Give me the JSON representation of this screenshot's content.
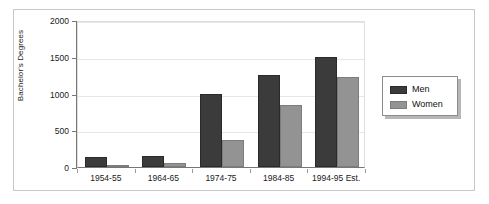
{
  "chart_data": {
    "type": "bar",
    "title": "",
    "xlabel": "",
    "ylabel": "Bachelor's Degrees",
    "ylim": [
      0,
      2000
    ],
    "yticks": [
      0,
      500,
      1000,
      1500,
      2000
    ],
    "ytick_labels": [
      "0",
      "500",
      "1000",
      "1500",
      "2000"
    ],
    "grid": true,
    "legend_position": "right",
    "categories": [
      "1954-55",
      "1964-65",
      "1974-75",
      "1984-85",
      "1994-95 Est."
    ],
    "series": [
      {
        "name": "Men",
        "color": "#3b3b3b",
        "values": [
          130,
          150,
          1000,
          1250,
          1500
        ]
      },
      {
        "name": "Women",
        "color": "#939393",
        "values": [
          10,
          55,
          370,
          850,
          1225
        ]
      }
    ]
  },
  "legend": {
    "items": [
      {
        "label": "Men"
      },
      {
        "label": "Women"
      }
    ]
  }
}
